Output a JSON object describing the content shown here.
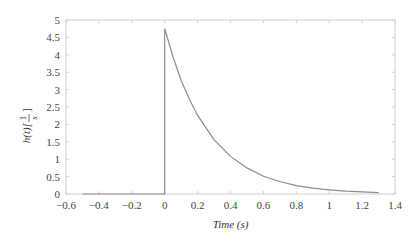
{
  "chart_data": {
    "type": "line",
    "title": "",
    "xlabel": "Time (s)",
    "ylabel": "h(t)[1/s]",
    "ylabel_parts": {
      "main": "h(t)[",
      "num": "1",
      "den": "s",
      "close": "]"
    },
    "xlim": [
      -0.6,
      1.4
    ],
    "ylim": [
      0,
      5
    ],
    "xticks": [
      -0.6,
      -0.4,
      -0.2,
      0,
      0.2,
      0.4,
      0.6,
      0.8,
      1,
      1.2,
      1.4
    ],
    "xtick_labels": [
      "-0.6",
      "-0.4",
      "-0.2",
      "0",
      "0.2",
      "0.4",
      "0.6",
      "0.8",
      "1",
      "1.2",
      "1.4"
    ],
    "yticks": [
      0,
      0.5,
      1,
      1.5,
      2,
      2.5,
      3,
      3.5,
      4,
      4.5,
      5
    ],
    "ytick_labels": [
      "0",
      "0.5",
      "1",
      "1.5",
      "2",
      "2.5",
      "3",
      "3.5",
      "4",
      "4.5",
      "5"
    ],
    "grid": false,
    "legend": null,
    "series": [
      {
        "name": "h(t)",
        "color": "#8c8c8c",
        "description": "Impulse response: 0 for t<0, jump at t=0 to ~4.75, exponential decay h(t)=4.75*exp(-t/0.27)",
        "x": [
          -0.5,
          -0.4,
          -0.2,
          0,
          0,
          0.05,
          0.1,
          0.15,
          0.2,
          0.3,
          0.4,
          0.5,
          0.6,
          0.7,
          0.8,
          0.9,
          1.0,
          1.1,
          1.2,
          1.3
        ],
        "y": [
          0,
          0,
          0,
          0,
          4.75,
          3.95,
          3.27,
          2.72,
          2.26,
          1.56,
          1.08,
          0.75,
          0.51,
          0.36,
          0.24,
          0.17,
          0.12,
          0.08,
          0.06,
          0.04
        ]
      }
    ]
  },
  "colors": {
    "axis": "#d0d0d0",
    "line": "#8c8c8c",
    "text": "#444444"
  }
}
